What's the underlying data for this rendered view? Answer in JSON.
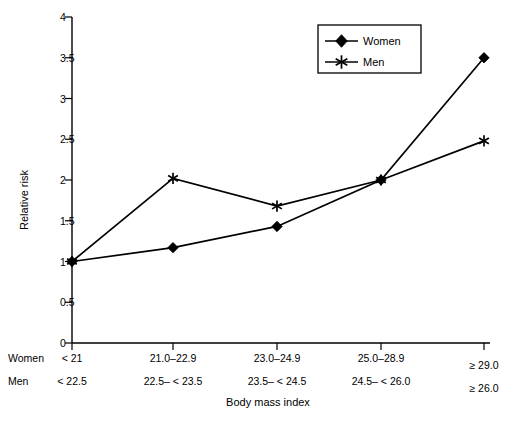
{
  "chart_data": {
    "type": "line",
    "title": "",
    "xlabel": "Body mass index",
    "ylabel": "Relative risk",
    "ylim": [
      0,
      4
    ],
    "yticks": [
      "0",
      "0.5",
      "1",
      "1.5",
      "2",
      "2.5",
      "3",
      "3.5",
      "4"
    ],
    "ytick_values": [
      0,
      0.5,
      1,
      1.5,
      2,
      2.5,
      3,
      3.5,
      4
    ],
    "grid": false,
    "legend_position": "top-right",
    "categories": [
      "1",
      "2",
      "3",
      "4",
      "5"
    ],
    "category_labels": {
      "women_row_header": "Women",
      "men_row_header": "Men",
      "women": [
        "< 21",
        "21.0–22.9",
        "23.0–24.9",
        "25.0–28.9",
        "≥ 29.0"
      ],
      "men": [
        "< 22.5",
        "22.5– < 23.5",
        "23.5– < 24.5",
        "24.5– < 26.0",
        "≥ 26.0"
      ]
    },
    "series": [
      {
        "name": "Women",
        "marker": "filled-diamond",
        "values": [
          1.0,
          1.17,
          1.43,
          2.0,
          3.5
        ]
      },
      {
        "name": "Men",
        "marker": "asterisk",
        "values": [
          1.0,
          2.02,
          1.68,
          2.0,
          2.48
        ]
      }
    ],
    "colors": {
      "line": "#000000",
      "marker": "#000000",
      "axis": "#000000",
      "background": "#ffffff"
    }
  },
  "legend": {
    "items": [
      {
        "label": "Women",
        "marker": "filled-diamond"
      },
      {
        "label": "Men",
        "marker": "asterisk"
      }
    ]
  }
}
